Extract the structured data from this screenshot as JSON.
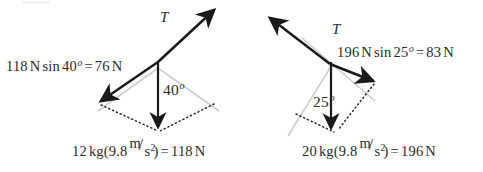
{
  "figure": {
    "background_color": "#ffffff",
    "ink_color": "#1a1a1a",
    "guide_color": "#c9c9c9",
    "dotted_color": "#2b2b2b"
  },
  "diagrams": [
    {
      "id": "left",
      "name": "12 kg mass diagram",
      "tension_label": "T",
      "angle_label": "40",
      "angle_degree_symbol": "o",
      "component_equation": {
        "full_text": "118 N sin 40o = 76 N",
        "force": "118",
        "force_unit": "N",
        "function": "sin",
        "angle": "40",
        "degree_symbol": "o",
        "equals": "=",
        "result": "76",
        "result_unit": "N"
      },
      "weight_equation": {
        "full_text": "12 kg(9.8 m/s2) = 118 N",
        "mass": "12",
        "mass_unit": "kg",
        "open_paren": "(",
        "gravity": "9.8",
        "accel_num": "m",
        "accel_slash": "/",
        "accel_den": "s",
        "accel_exp": "2",
        "close_paren": ")",
        "equals": "=",
        "result": "118",
        "result_unit": "N"
      }
    },
    {
      "id": "right",
      "name": "20 kg mass diagram",
      "tension_label": "T",
      "angle_label": "25",
      "angle_degree_symbol": "o",
      "component_equation": {
        "full_text": "196 N sin 25o = 83 N",
        "force": "196",
        "force_unit": "N",
        "function": "sin",
        "angle": "25",
        "degree_symbol": "o",
        "equals": "=",
        "result": "83",
        "result_unit": "N"
      },
      "weight_equation": {
        "full_text": "20 kg(9.8 m/s2) = 196 N",
        "mass": "20",
        "mass_unit": "kg",
        "open_paren": "(",
        "gravity": "9.8",
        "accel_num": "m",
        "accel_slash": "/",
        "accel_den": "s",
        "accel_exp": "2",
        "close_paren": ")",
        "equals": "=",
        "result": "196",
        "result_unit": "N"
      }
    }
  ]
}
